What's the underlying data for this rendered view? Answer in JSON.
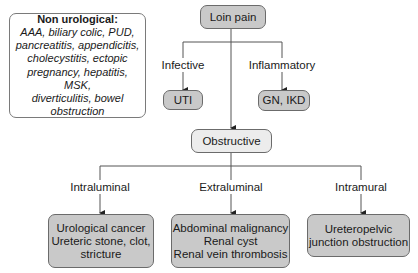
{
  "diagram": {
    "root": {
      "label": "Loin pain"
    },
    "non_urological": {
      "title": "Non urological:",
      "lines": [
        "AAA, biliary colic, PUD,",
        "pancreatitis, appendicitis,",
        "cholecystitis, ectopic",
        "pregnancy, hepatitis, MSK,",
        "diverticulitis, bowel",
        "obstruction"
      ]
    },
    "branches": {
      "infective": {
        "edge_label": "Infective",
        "node": "UTI"
      },
      "inflammatory": {
        "edge_label": "Inflammatory",
        "node": "GN, IKD"
      },
      "obstructive": {
        "node": "Obstructive"
      }
    },
    "obstructive_children": {
      "intraluminal": {
        "edge_label": "Intraluminal",
        "lines": [
          "Urological cancer",
          "Ureteric stone, clot,",
          "stricture"
        ]
      },
      "extraluminal": {
        "edge_label": "Extraluminal",
        "lines": [
          "Abdominal malignancy",
          "Renal cyst",
          "Renal vein thrombosis"
        ]
      },
      "intramural": {
        "edge_label": "Intramural",
        "lines": [
          "Ureteropelvic",
          "junction obstruction"
        ]
      }
    },
    "colors": {
      "dark_fill": "#c9c9c9",
      "light_fill": "#ececec",
      "line": "#555555"
    }
  }
}
